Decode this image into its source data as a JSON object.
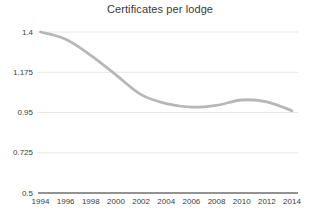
{
  "title": "Certificates per lodge",
  "colors": {
    "background": "#ffffff",
    "line": "#b7b7b7",
    "grid": "#e7e7e7",
    "axis": "#262626",
    "tick_label": "#3d3d3d",
    "title": "#3a3a3a"
  },
  "chart_data": {
    "type": "line",
    "title": "Certificates per lodge",
    "series": [
      {
        "name": "Certificates per lodge",
        "x": [
          1994,
          1996,
          1998,
          2000,
          2002,
          2004,
          2006,
          2008,
          2010,
          2012,
          2014
        ],
        "values": [
          1.4,
          1.36,
          1.27,
          1.16,
          1.05,
          1.0,
          0.98,
          0.99,
          1.02,
          1.01,
          0.96
        ]
      }
    ],
    "xlabel": "",
    "ylabel": "",
    "xlim": [
      1994,
      2014
    ],
    "ylim": [
      0.5,
      1.4
    ],
    "yticks": [
      1.4,
      1.175,
      0.95,
      0.725,
      0.5
    ],
    "ytick_labels": [
      "1.4",
      "1.175",
      "0.95",
      "0.725",
      "0.5"
    ],
    "xticks": [
      1994,
      1996,
      1998,
      2000,
      2002,
      2004,
      2006,
      2008,
      2010,
      2012,
      2014
    ],
    "xtick_labels": [
      "1994",
      "1996",
      "1998",
      "2000",
      "2002",
      "2004",
      "2006",
      "2008",
      "2010",
      "2012",
      "2014"
    ],
    "grid": "horizontal",
    "legend": "none",
    "line_style": "smooth"
  }
}
